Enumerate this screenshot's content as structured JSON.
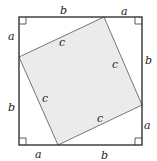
{
  "diagram": {
    "colors": {
      "stroke": "#333333",
      "fill": "#ebebeb",
      "background": "#ffffff"
    },
    "outer_square": {
      "x": 19,
      "y": 17,
      "size": 123
    },
    "inner_square": {
      "points": [
        [
          104,
          17
        ],
        [
          142,
          105
        ],
        [
          58,
          145
        ],
        [
          19,
          57
        ]
      ]
    },
    "edge_labels": {
      "top": [
        "b",
        "a"
      ],
      "right": [
        "b",
        "a"
      ],
      "bottom": [
        "a",
        "b"
      ],
      "left": [
        "a",
        "b"
      ]
    },
    "hypotenuse_labels": [
      "c",
      "c",
      "c",
      "c"
    ],
    "right_angle_markers": [
      "top-left",
      "top-right",
      "bottom-left",
      "bottom-right"
    ]
  }
}
